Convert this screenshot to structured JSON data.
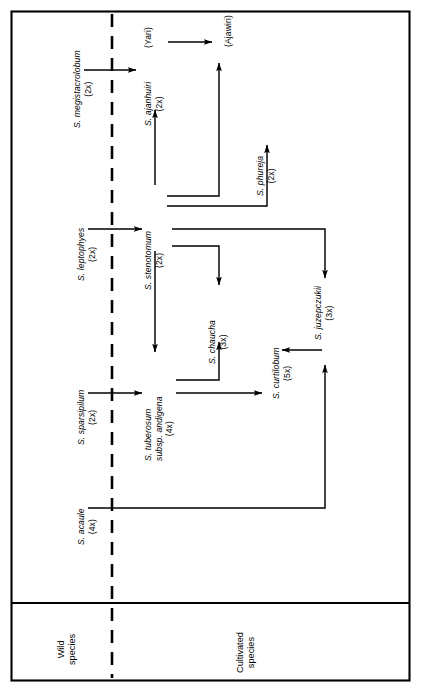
{
  "figure": {
    "orientation": "landscape-rotated",
    "panels": [
      {
        "id": "wild",
        "label_line1": "Wild",
        "label_line2": "species"
      },
      {
        "id": "cultivated",
        "label_line1": "Cultivated",
        "label_line2": "species"
      }
    ],
    "divider": {
      "style": "dashed",
      "color": "#000000"
    },
    "frame_color": "#000000"
  },
  "nodes": [
    {
      "id": "megistacrolobum",
      "name": "S. megistacrolobum",
      "ploidy": "(2x)",
      "group": "wild",
      "italic": true
    },
    {
      "id": "leptophyes",
      "name": "S. leptophyes",
      "ploidy": "(2x)",
      "group": "wild",
      "italic": true
    },
    {
      "id": "sparsipilum",
      "name": "S. sparsipilum",
      "ploidy": "(2x)",
      "group": "wild",
      "italic": true
    },
    {
      "id": "acaule",
      "name": "S. acaule",
      "ploidy": "(4x)",
      "group": "wild",
      "italic": true
    },
    {
      "id": "ajanhuiri",
      "name": "S. ajanhuiri",
      "ploidy": "(2x)",
      "group": "cultivated",
      "italic": true
    },
    {
      "id": "yari",
      "name": "(Yari)",
      "ploidy": "",
      "group": "cultivated",
      "italic": false
    },
    {
      "id": "ajawiri",
      "name": "(Ajawiri)",
      "ploidy": "",
      "group": "cultivated",
      "italic": false
    },
    {
      "id": "stenotomum",
      "name": "S. stenotomum",
      "ploidy": "(2x)",
      "group": "cultivated",
      "italic": true
    },
    {
      "id": "phureja",
      "name": "S. phureja",
      "ploidy": "(2x)",
      "group": "cultivated",
      "italic": true
    },
    {
      "id": "chaucha",
      "name": "S. chaucha",
      "ploidy": "(3x)",
      "group": "cultivated",
      "italic": true
    },
    {
      "id": "tuberosum",
      "name": "S. tuberosum",
      "name2": "subsp. andigena",
      "ploidy": "(4x)",
      "group": "cultivated",
      "italic": true
    },
    {
      "id": "curtilobum",
      "name": "S. curtilobum",
      "ploidy": "(5x)",
      "group": "cultivated",
      "italic": true
    },
    {
      "id": "juzepczukii",
      "name": "S. juzepczukii",
      "ploidy": "(3x)",
      "group": "cultivated",
      "italic": true
    }
  ],
  "edges": [
    {
      "from": "megistacrolobum",
      "to": "ajanhuiri"
    },
    {
      "from": "ajanhuiri",
      "to": "yari"
    },
    {
      "from": "yari",
      "to": "ajawiri"
    },
    {
      "from": "stenotomum",
      "to": "ajanhuiri"
    },
    {
      "from": "stenotomum",
      "to": "ajawiri"
    },
    {
      "from": "stenotomum",
      "to": "phureja"
    },
    {
      "from": "leptophyes",
      "to": "stenotomum"
    },
    {
      "from": "stenotomum",
      "to": "chaucha"
    },
    {
      "from": "stenotomum",
      "to": "tuberosum"
    },
    {
      "from": "stenotomum",
      "to": "juzepczukii"
    },
    {
      "from": "sparsipilum",
      "to": "tuberosum"
    },
    {
      "from": "tuberosum",
      "to": "chaucha"
    },
    {
      "from": "tuberosum",
      "to": "curtilobum"
    },
    {
      "from": "juzepczukii",
      "to": "curtilobum"
    },
    {
      "from": "acaule",
      "to": "juzepczukii"
    }
  ]
}
